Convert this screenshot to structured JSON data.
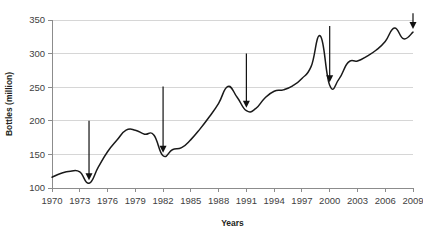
{
  "chart_data": {
    "type": "line",
    "title": "",
    "xlabel": "Years",
    "ylabel": "Bottles (million)",
    "xlim": [
      1970,
      2009
    ],
    "ylim": [
      100,
      350
    ],
    "grid": true,
    "legend": null,
    "y_ticks": [
      100,
      150,
      200,
      250,
      300,
      350
    ],
    "x_ticks": [
      1970,
      1973,
      1976,
      1979,
      1982,
      1985,
      1988,
      1991,
      1994,
      1997,
      2000,
      2003,
      2006,
      2009
    ],
    "series": [
      {
        "name": "Bottles",
        "x": [
          1970,
          1971,
          1972,
          1973,
          1974,
          1975,
          1976,
          1977,
          1978,
          1979,
          1980,
          1981,
          1982,
          1983,
          1984,
          1985,
          1986,
          1987,
          1988,
          1989,
          1990,
          1991,
          1992,
          1993,
          1994,
          1995,
          1996,
          1997,
          1998,
          1999,
          2000,
          2001,
          2002,
          2003,
          2004,
          2005,
          2006,
          2007,
          2008,
          2009
        ],
        "values": [
          116,
          122,
          125,
          124,
          107,
          131,
          154,
          171,
          186,
          186,
          180,
          179,
          148,
          157,
          160,
          172,
          188,
          206,
          226,
          251,
          235,
          215,
          218,
          234,
          244,
          246,
          252,
          263,
          281,
          326,
          253,
          262,
          287,
          289,
          296,
          305,
          318,
          338,
          322,
          332
        ]
      }
    ],
    "annotations": [
      {
        "label": "arrow-1974",
        "x": 1974,
        "y": 107,
        "shaft_top": 200,
        "direction": "down"
      },
      {
        "label": "arrow-1982",
        "x": 1982,
        "y": 148,
        "shaft_top": 251,
        "direction": "down"
      },
      {
        "label": "arrow-1991",
        "x": 1991,
        "y": 215,
        "shaft_top": 300,
        "direction": "down"
      },
      {
        "label": "arrow-2000",
        "x": 2000,
        "y": 253,
        "shaft_top": 341,
        "direction": "down"
      },
      {
        "label": "arrow-2009",
        "x": 2009,
        "y": 332,
        "shaft_top": 360,
        "direction": "down"
      }
    ],
    "colors": {
      "line": "#1a1a1a",
      "grid": "#d6d6d6",
      "axis": "#8c8c8c",
      "text": "#414141",
      "annotation": "#111111",
      "background": "#ffffff"
    }
  }
}
